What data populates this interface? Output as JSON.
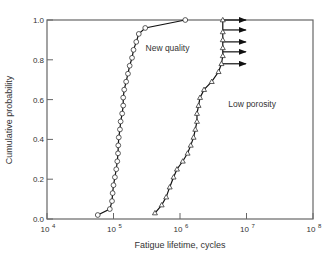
{
  "chart_data": {
    "type": "line",
    "title": "",
    "xlabel": "Fatigue lifetime, cycles",
    "ylabel": "Cumulative probability",
    "xscale": "log",
    "xlim": [
      10000,
      100000000
    ],
    "ylim": [
      0.0,
      1.0
    ],
    "x_ticks": [
      {
        "exp": "4"
      },
      {
        "exp": "5"
      },
      {
        "exp": "6"
      },
      {
        "exp": "7"
      },
      {
        "exp": "8"
      }
    ],
    "y_ticks": [
      "0.0",
      "0.2",
      "0.4",
      "0.6",
      "0.8",
      "1.0"
    ],
    "grid": false,
    "series": [
      {
        "name": "New quality",
        "marker": "circle",
        "points": [
          [
            58000,
            0.02
          ],
          [
            88000,
            0.05
          ],
          [
            95000,
            0.09
          ],
          [
            97000,
            0.13
          ],
          [
            100000,
            0.17
          ],
          [
            105000,
            0.21
          ],
          [
            110000,
            0.25
          ],
          [
            114000,
            0.29
          ],
          [
            117000,
            0.33
          ],
          [
            118000,
            0.37
          ],
          [
            120000,
            0.41
          ],
          [
            125000,
            0.45
          ],
          [
            128000,
            0.49
          ],
          [
            135000,
            0.53
          ],
          [
            140000,
            0.57
          ],
          [
            140000,
            0.61
          ],
          [
            145000,
            0.65
          ],
          [
            155000,
            0.69
          ],
          [
            165000,
            0.73
          ],
          [
            175000,
            0.77
          ],
          [
            190000,
            0.81
          ],
          [
            200000,
            0.85
          ],
          [
            220000,
            0.89
          ],
          [
            240000,
            0.93
          ],
          [
            300000,
            0.96
          ],
          [
            1200000,
            1.0
          ]
        ]
      },
      {
        "name": "Low porosity",
        "marker": "triangle",
        "points": [
          [
            420000,
            0.03
          ],
          [
            530000,
            0.07
          ],
          [
            620000,
            0.11
          ],
          [
            700000,
            0.16
          ],
          [
            800000,
            0.21
          ],
          [
            900000,
            0.25
          ],
          [
            1100000,
            0.29
          ],
          [
            1300000,
            0.33
          ],
          [
            1450000,
            0.37
          ],
          [
            1600000,
            0.41
          ],
          [
            1700000,
            0.45
          ],
          [
            1800000,
            0.49
          ],
          [
            1800000,
            0.53
          ],
          [
            1900000,
            0.57
          ],
          [
            2000000,
            0.61
          ],
          [
            2300000,
            0.65
          ],
          [
            3000000,
            0.69
          ],
          [
            3800000,
            0.74
          ],
          [
            4200000,
            0.78
          ],
          [
            4400000,
            0.82
          ],
          [
            4400000,
            0.86
          ],
          [
            4400000,
            0.9
          ],
          [
            4400000,
            0.94
          ],
          [
            4400000,
            1.0
          ]
        ],
        "runouts": [
          {
            "x": 4400000,
            "y": 0.78
          },
          {
            "x": 4400000,
            "y": 0.84
          },
          {
            "x": 4400000,
            "y": 0.89
          },
          {
            "x": 4400000,
            "y": 0.95
          },
          {
            "x": 4400000,
            "y": 1.0
          }
        ]
      }
    ],
    "annotations": [
      {
        "text": "New quality",
        "x": 400000,
        "y": 0.86
      },
      {
        "text": "Low porosity",
        "x": 7000000,
        "y": 0.58
      }
    ]
  },
  "labels": {
    "x_base": "10",
    "xlabel": "Fatigue lifetime, cycles",
    "ylabel": "Cumulative probability"
  }
}
